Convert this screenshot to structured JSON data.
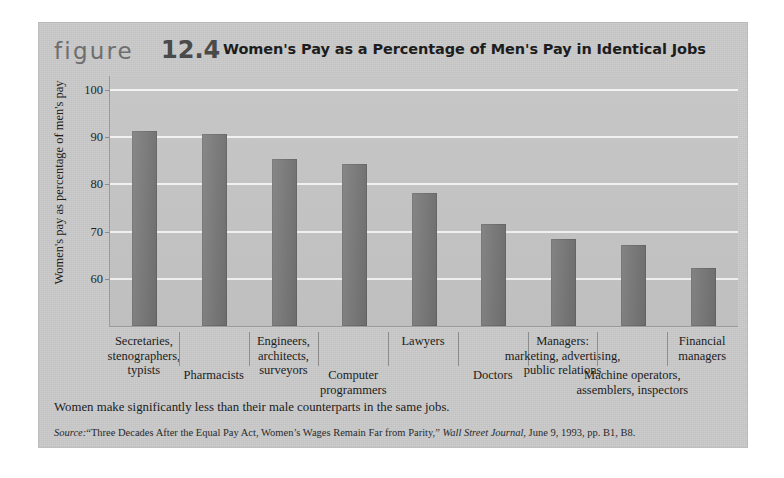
{
  "figure": {
    "word": "figure",
    "number": "12.4",
    "title": "Women's Pay as a Percentage of Men's Pay in Identical Jobs",
    "caption": "Women make significantly less than their male counterparts in the same jobs.",
    "source_label": "Source:",
    "source_text_1": "“Three  Decades After the Equal Pay Act, Women’s Wages Remain Far from Parity,”",
    "source_publication": "Wall Street Journal",
    "source_text_2": ", June 9, 1993, pp. B1, B8."
  },
  "colors": {
    "card_background": "#c9c9c9",
    "plot_background": "#c3c3c3",
    "bar": "#757575",
    "gridline": "#f2f2f2",
    "axis": "#9a9a9a",
    "text": "#1c1c1c",
    "figure_word": "#6e6e6e",
    "figure_number": "#4a4a4a"
  },
  "chart_data": {
    "type": "bar",
    "title": "Women's Pay as a Percentage of Men's Pay in Identical Jobs",
    "xlabel": "",
    "ylabel": "Women's pay as percentage of men's pay",
    "ylim": [
      50,
      103
    ],
    "yticks": [
      60,
      70,
      80,
      90,
      100
    ],
    "ytick_labels": [
      "60",
      "70",
      "80",
      "90",
      "100"
    ],
    "grid": "horizontal",
    "legend": "none",
    "categories": [
      "Secretaries,\nstenographers,\ntypists",
      "Pharmacists",
      "Engineers,\narchitects,\nsurveyors",
      "Computer\nprogrammers",
      "Lawyers",
      "Doctors",
      "Managers:\nmarketing, advertising,\npublic relations",
      "Machine operators,\nassemblers, inspectors",
      "Financial\nmanagers"
    ],
    "values": [
      91.3,
      90.8,
      85.5,
      84.3,
      78.2,
      71.6,
      68.5,
      67.2,
      62.3
    ]
  },
  "category_labels": [
    {
      "lines": [
        "Secretaries,",
        "stenographers,",
        "typists"
      ],
      "row": "upper"
    },
    {
      "lines": [
        "Pharmacists"
      ],
      "row": "lower"
    },
    {
      "lines": [
        "Engineers,",
        "architects,",
        "surveyors"
      ],
      "row": "upper"
    },
    {
      "lines": [
        "Computer",
        "programmers"
      ],
      "row": "lower"
    },
    {
      "lines": [
        "Lawyers"
      ],
      "row": "upper"
    },
    {
      "lines": [
        "Doctors"
      ],
      "row": "lower"
    },
    {
      "lines": [
        "Managers:",
        "marketing, advertising,",
        "public relations"
      ],
      "row": "upper"
    },
    {
      "lines": [
        "Machine operators,",
        "assemblers, inspectors"
      ],
      "row": "lower"
    },
    {
      "lines": [
        "Financial",
        "managers"
      ],
      "row": "upper"
    }
  ]
}
